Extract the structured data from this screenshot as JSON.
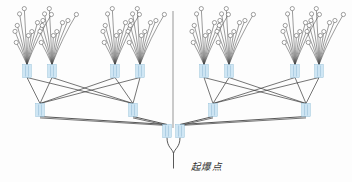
{
  "figure": {
    "title": "起爆点",
    "kind": "blasting-network-diagram",
    "label_detonation_point": "起爆点",
    "background_color": "#fdfdfd",
    "connector_fill": "#cfe6f4",
    "connector_stroke": "#8fbcd8",
    "wire_color": "#4a4a4a",
    "hole_fill": "#ffffff",
    "hole_stroke": "#555555",
    "divider_color": "#6b6b6b"
  },
  "chart_data": {
    "type": "diagram",
    "title": "起爆点",
    "levels": [
      {
        "level": 1,
        "name": "blast-hole-fans",
        "count": 8,
        "nodes_per_fan": 10
      },
      {
        "level": 2,
        "name": "level-1-connectors",
        "count": 8
      },
      {
        "level": 3,
        "name": "level-2-connectors",
        "count": 4
      },
      {
        "level": 4,
        "name": "detonation-connector",
        "count": 2
      }
    ],
    "divider": {
      "x": 173,
      "y1": 11,
      "y2": 128,
      "orientation": "vertical"
    },
    "fan_apex_x": [
      27,
      52,
      115,
      140,
      204,
      229,
      295,
      319
    ],
    "fan_apex_y": 71,
    "level1_connector_x": [
      27,
      52,
      115,
      140,
      204,
      229,
      295,
      319
    ],
    "level1_connector_y": 71,
    "level2_connector_x": [
      40,
      133,
      213,
      306
    ],
    "level2_connector_y": 110,
    "detonation_connector_x": [
      167,
      180
    ],
    "detonation_connector_y": 131,
    "label_position": {
      "x": 191,
      "y": 170
    }
  },
  "geometry": {
    "connector": {
      "w": 8.5,
      "h": 13
    },
    "hole_radius": 2.1,
    "fan_spread_deg": 64,
    "fan_rows": 5
  }
}
